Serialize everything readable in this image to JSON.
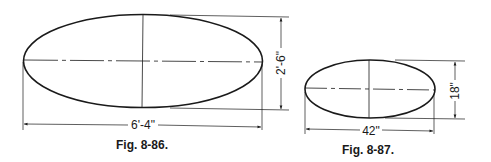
{
  "figures": [
    {
      "caption": "Fig. 8-86.",
      "shape": "ellipse",
      "width_label": "6'-4\"",
      "height_label": "2'-6\"",
      "geometry": {
        "cx": 143,
        "cy": 61,
        "rx": 119.5,
        "ry": 46.5
      }
    },
    {
      "caption": "Fig. 8-87.",
      "shape": "ellipse",
      "width_label": "42\"",
      "height_label": "18\"",
      "geometry": {
        "cx": 370,
        "cy": 89,
        "rx": 65,
        "ry": 29
      }
    }
  ],
  "colors": {
    "line": "#1a1a1a",
    "background": "#ffffff"
  }
}
